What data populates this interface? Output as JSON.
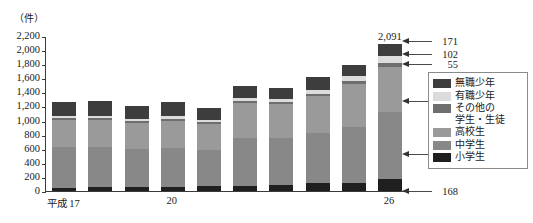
{
  "unit_label": "（件）",
  "axis": {
    "y_ticks": [
      "2,200",
      "2,000",
      "1,800",
      "1,600",
      "1,400",
      "1,200",
      "1,000",
      "800",
      "600",
      "400",
      "200",
      "0"
    ],
    "y_min": 0,
    "y_max": 2200,
    "x_labels": [
      {
        "text": "平成 17",
        "index": 0
      },
      {
        "text": "20",
        "index": 3
      },
      {
        "text": "26",
        "index": 9
      }
    ]
  },
  "legend": {
    "items": [
      {
        "label": "無職少年",
        "color": "#3d3d3d"
      },
      {
        "label": "有職少年",
        "color": "#dcdcdc"
      },
      {
        "label": "その他の\n学生・生徒",
        "color": "#6e6e6e"
      },
      {
        "label": "高校生",
        "color": "#9a9a9a"
      },
      {
        "label": "中学生",
        "color": "#888888"
      },
      {
        "label": "小学生",
        "color": "#1f1f1f"
      }
    ]
  },
  "callouts": [
    {
      "name": "callout-mushoku",
      "value": "171",
      "top": 35
    },
    {
      "name": "callout-yushoku",
      "value": "102",
      "top": 48
    },
    {
      "name": "callout-sonota",
      "value": "55",
      "top": 58
    },
    {
      "name": "callout-koukou",
      "value": "648",
      "top": 95
    },
    {
      "name": "callout-chugaku",
      "value": "947",
      "top": 148
    },
    {
      "name": "callout-shougaku",
      "value": "168",
      "top": 185
    }
  ],
  "chart_data": {
    "type": "bar",
    "subtype": "stacked",
    "title": "",
    "xlabel": "",
    "ylabel": "（件）",
    "ylim": [
      0,
      2200
    ],
    "grid": false,
    "legend_position": "right",
    "categories": [
      "平成17",
      "18",
      "19",
      "20",
      "21",
      "22",
      "23",
      "24",
      "25",
      "26"
    ],
    "series": [
      {
        "name": "小学生",
        "color": "#1f1f1f",
        "values": [
          40,
          55,
          62,
          60,
          72,
          78,
          82,
          108,
          118,
          168
        ]
      },
      {
        "name": "中学生",
        "color": "#888888",
        "values": [
          580,
          570,
          530,
          555,
          508,
          678,
          672,
          718,
          795,
          947
        ]
      },
      {
        "name": "高校生",
        "color": "#9a9a9a",
        "values": [
          395,
          390,
          378,
          385,
          375,
          490,
          475,
          520,
          610,
          648
        ]
      },
      {
        "name": "その他の学生・生徒",
        "color": "#6e6e6e",
        "values": [
          25,
          25,
          22,
          24,
          25,
          30,
          28,
          33,
          38,
          55
        ]
      },
      {
        "name": "有職少年",
        "color": "#dcdcdc",
        "values": [
          30,
          32,
          28,
          35,
          32,
          45,
          45,
          55,
          68,
          102
        ]
      },
      {
        "name": "無職少年",
        "color": "#3d3d3d",
        "values": [
          195,
          208,
          188,
          200,
          163,
          165,
          158,
          192,
          165,
          171
        ]
      }
    ],
    "totals": [
      1265,
      1280,
      1208,
      1259,
      1175,
      1486,
      1460,
      1626,
      1794,
      2091
    ],
    "labeled_totals": [
      {
        "index": 9,
        "text": "2,091"
      }
    ],
    "last_bar_breakdown": {
      "小学生": 168,
      "中学生": 947,
      "高校生": 648,
      "その他の学生・生徒": 55,
      "有職少年": 102,
      "無職少年": 171,
      "total": 2091
    }
  }
}
